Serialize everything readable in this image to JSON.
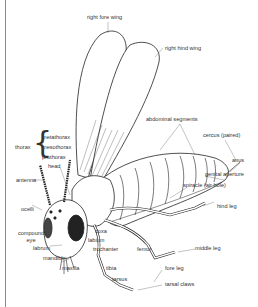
{
  "diagram": {
    "labels": {
      "right_fore_wing": "right fore wing",
      "right_hind_wing": "right hind wing",
      "abdominal_segments": "abdominal segments",
      "cercus": "cercus (paired)",
      "anus": "anus",
      "genital_aperture": "genital aperture",
      "spiracle": "spiracle (air hole)",
      "hind_leg": "hind leg",
      "middle_leg": "middle leg",
      "fore_leg": "fore leg",
      "tarsal_claws": "tarsal claws",
      "thorax": "thorax",
      "metathorax": "metathorax",
      "mesothorax": "mesothorax",
      "prothorax": "prothorax",
      "head": "head",
      "antenna": "antenna",
      "ocelli": "ocelli",
      "compound_eye_1": "compound",
      "compound_eye_2": "eye",
      "labrum": "labrum",
      "mandible": "mandible",
      "maxilla": "maxilla",
      "coxa": "coxa",
      "labium": "labium",
      "trochanter": "trochanter",
      "tibia": "tibia",
      "femur": "femur",
      "tarsus": "tarsus"
    },
    "colors": {
      "ink": "#222222",
      "background": "#ffffff",
      "frame": "#8a8a8a"
    }
  }
}
